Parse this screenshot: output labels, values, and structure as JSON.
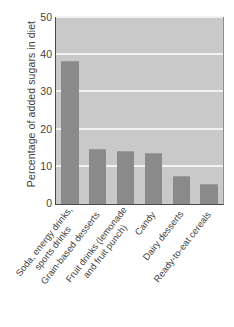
{
  "chart_data": {
    "type": "bar",
    "title": "",
    "xlabel": "",
    "ylabel": "Percentage of added sugars in diet",
    "ylim": [
      0,
      50
    ],
    "yticks": [
      0,
      10,
      20,
      30,
      40,
      50
    ],
    "grid": true,
    "legend": null,
    "categories": [
      "Soda, energy drinks, sports drinks",
      "Grain-based desserts",
      "Fruit drinks (lemonade and fruit punch)",
      "Candy",
      "Dairy desserts",
      "Ready-to-eat cereals"
    ],
    "category_lines": [
      [
        "Soda, energy drinks,",
        "sports drinks"
      ],
      [
        "Grain-based desserts"
      ],
      [
        "Fruit drinks (lemonade",
        "and fruit punch)"
      ],
      [
        "Candy"
      ],
      [
        "Dairy desserts"
      ],
      [
        "Ready-to-eat cereals"
      ]
    ],
    "values": [
      38.3,
      14.6,
      14.1,
      13.5,
      7.3,
      5.0
    ],
    "colors": {
      "bar": "#8a8a8a",
      "plot_background": "#c9c9c9",
      "gridline": "#f2f2f2",
      "axis": "#4a4a4a",
      "text": "#3f3f3f",
      "page_background": "#ffffff"
    }
  },
  "axis": {
    "yticks_text": [
      "0",
      "10",
      "20",
      "30",
      "40",
      "50"
    ],
    "ylabel_text": "Percentage of added sugars in diet"
  }
}
